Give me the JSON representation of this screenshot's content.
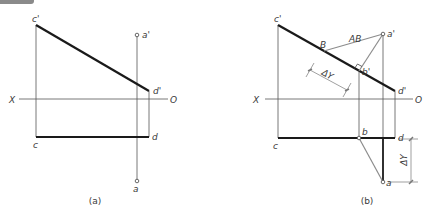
{
  "diagram": {
    "type": "orthographic projection – true length of line AB via perpendicular to frontal projection",
    "colors": {
      "thick_line": "#1a1a1a",
      "thin_line": "#555555",
      "construction_line": "#8c8c8c",
      "corner_tab": "#8a8a8a"
    },
    "panel_a": {
      "caption": "(a)",
      "axis_left_label": "X",
      "axis_right_label": "O",
      "labels": {
        "c_prime": "c'",
        "d_prime": "d'",
        "c": "c",
        "d": "d",
        "a_prime": "a'",
        "a": "a"
      }
    },
    "panel_b": {
      "caption": "(b)",
      "axis_left_label": "X",
      "axis_right_label": "O",
      "labels": {
        "c_prime": "c'",
        "d_prime": "d'",
        "c": "c",
        "d": "d",
        "a_prime": "a'",
        "a": "a",
        "b_prime": "b'",
        "b": "b",
        "B": "B",
        "AB": "AB"
      },
      "dimension_oblique": "ΔY",
      "dimension_vertical": "ΔY"
    }
  }
}
